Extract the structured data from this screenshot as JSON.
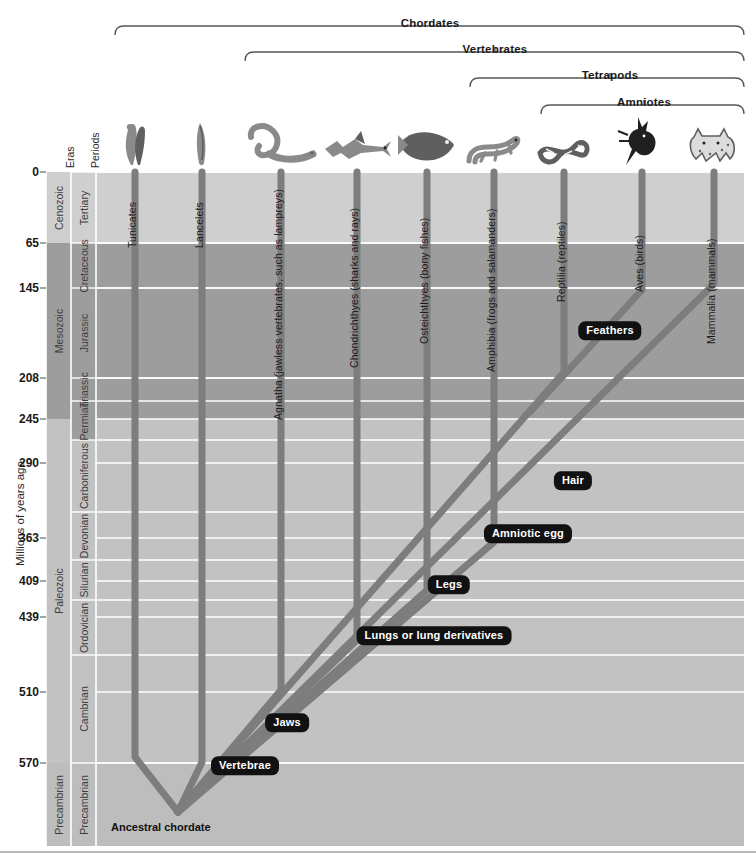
{
  "figure": {
    "type": "phylogenetic-tree",
    "y_axis_title": "Millions of years ago",
    "column_headers": {
      "eras": "Eras",
      "periods": "Periods"
    },
    "root_label": "Ancestral chordate",
    "background": "#ffffff",
    "lineage_color": "#7d7d7d",
    "callout_bg": "#111111"
  },
  "clade_brackets": [
    {
      "label": "Chordates",
      "x1": 115,
      "x2": 744,
      "label_x": 430,
      "y": 17,
      "bracket_y": 26
    },
    {
      "label": "Vertebrates",
      "x1": 245,
      "x2": 744,
      "label_x": 495,
      "y": 43,
      "bracket_y": 52
    },
    {
      "label": "Tetrapods",
      "x1": 470,
      "x2": 744,
      "label_x": 610,
      "y": 69,
      "bracket_y": 78
    },
    {
      "label": "Amniotes",
      "x1": 541,
      "x2": 744,
      "label_x": 644,
      "y": 96,
      "bracket_y": 105
    }
  ],
  "time_axis": {
    "unit": "Millions of years ago",
    "ticks": [
      0,
      65,
      145,
      208,
      245,
      290,
      363,
      409,
      439,
      510,
      570
    ],
    "tick_y_px": [
      172,
      243,
      288,
      378,
      419,
      463,
      538,
      581,
      617,
      692,
      763
    ],
    "top_px": 172,
    "bottom_px": 846
  },
  "eras": [
    {
      "name": "Cenozoic",
      "from": 0,
      "to": 65,
      "y0": 172,
      "y1": 243,
      "color": "#cfcfcf"
    },
    {
      "name": "Mesozoic",
      "from": 65,
      "to": 245,
      "y0": 243,
      "y1": 419,
      "color": "#9d9d9d"
    },
    {
      "name": "Paleozoic",
      "from": 245,
      "to": 570,
      "y0": 419,
      "y1": 763,
      "color": "#c2c2c2"
    },
    {
      "name": "Precambrian",
      "from": 570,
      "to": 650,
      "y0": 763,
      "y1": 846,
      "color": "#bdbdbd"
    }
  ],
  "periods": [
    {
      "name": "Tertiary",
      "y0": 172,
      "y1": 243
    },
    {
      "name": "Cretaceous",
      "y0": 243,
      "y1": 288
    },
    {
      "name": "Jurassic",
      "y0": 288,
      "y1": 378
    },
    {
      "name": "Triassic",
      "y0": 378,
      "y1": 401
    },
    {
      "name": "Permian",
      "y0": 401,
      "y1": 440
    },
    {
      "name": "Carboniferous",
      "y0": 440,
      "y1": 512
    },
    {
      "name": "Devonian",
      "y0": 512,
      "y1": 560
    },
    {
      "name": "Silurian",
      "y0": 560,
      "y1": 600
    },
    {
      "name": "Ordovician",
      "y0": 600,
      "y1": 655
    },
    {
      "name": "Cambrian",
      "y0": 655,
      "y1": 763
    },
    {
      "name": "Precambrian",
      "y0": 763,
      "y1": 846
    }
  ],
  "taxa": [
    {
      "label": "Tunicates",
      "x": 135,
      "label_y": 248,
      "icon": "tunicate-icon"
    },
    {
      "label": "Lancelets",
      "x": 202,
      "label_y": 248,
      "icon": "lancelet-icon"
    },
    {
      "label": "Agnatha (jawless vertebrates, such as lampreys)",
      "x": 281,
      "label_y": 420,
      "icon": "lamprey-icon"
    },
    {
      "label": "Chondrichthyes (sharks and rays)",
      "x": 357,
      "label_y": 368,
      "icon": "shark-icon"
    },
    {
      "label": "Osteichthyes (bony fishes)",
      "x": 427,
      "label_y": 344,
      "icon": "bony-fish-icon"
    },
    {
      "label": "Amphibia (frogs and salamanders)",
      "x": 494,
      "label_y": 372,
      "icon": "salamander-icon"
    },
    {
      "label": "Reptilia (reptiles)",
      "x": 564,
      "label_y": 302,
      "icon": "snake-icon"
    },
    {
      "label": "Aves (birds)",
      "x": 642,
      "label_y": 292,
      "icon": "bird-icon"
    },
    {
      "label": "Mammalia (mammals)",
      "x": 714,
      "label_y": 344,
      "icon": "mammal-icon"
    }
  ],
  "innovations": [
    {
      "label": "Vertebrae",
      "x": 245,
      "y": 766
    },
    {
      "label": "Jaws",
      "x": 287,
      "y": 723
    },
    {
      "label": "Lungs or lung derivatives",
      "x": 434,
      "y": 636
    },
    {
      "label": "Legs",
      "x": 449,
      "y": 585
    },
    {
      "label": "Amniotic egg",
      "x": 528,
      "y": 534
    },
    {
      "label": "Hair",
      "x": 573,
      "y": 481
    },
    {
      "label": "Feathers",
      "x": 610,
      "y": 331
    }
  ],
  "lineage_paths": {
    "root_x": 178,
    "root_y": 812,
    "description": "Branches radiate from the ancestral chordate at the base and rise to nine extant terminal taxa."
  }
}
